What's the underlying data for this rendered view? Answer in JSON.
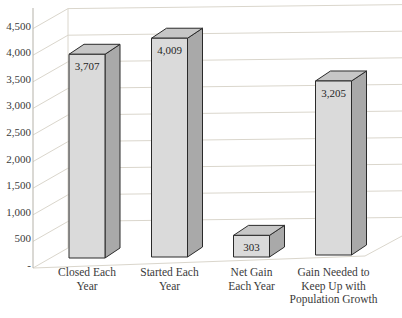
{
  "chart_data": {
    "type": "bar",
    "style": "3d-column",
    "title": "",
    "xlabel": "",
    "ylabel": "",
    "legend": false,
    "grid": true,
    "ylim": [
      0,
      4500
    ],
    "categories": [
      [
        "Closed Each",
        "Year"
      ],
      [
        "Started Each",
        "Year"
      ],
      [
        "Net Gain",
        "Each Year"
      ],
      [
        "Gain Needed to",
        "Keep Up with",
        "Population Growth"
      ]
    ],
    "values": [
      3707,
      4009,
      303,
      3205
    ],
    "value_labels": [
      "3,707",
      "4,009",
      "303",
      "3,205"
    ],
    "y_ticks": [
      {
        "value": 0,
        "label": "-"
      },
      {
        "value": 500,
        "label": "500"
      },
      {
        "value": 1000,
        "label": "1,000"
      },
      {
        "value": 1500,
        "label": "1,500"
      },
      {
        "value": 2000,
        "label": "2,000"
      },
      {
        "value": 2500,
        "label": "2,500"
      },
      {
        "value": 3000,
        "label": "3,000"
      },
      {
        "value": 3500,
        "label": "3,500"
      },
      {
        "value": 4000,
        "label": "4,000"
      },
      {
        "value": 4500,
        "label": "4,500"
      }
    ],
    "colors": {
      "bar_front": "#dadada",
      "bar_top": "#c6c6c6",
      "bar_side": "#a9a9a9",
      "bar_outline": "#2a2a2a",
      "gridline": "#dad6cc",
      "axis_line": "#b5b2a9",
      "tick_text": "#3a3a3a",
      "value_text": "#262626",
      "background": "#ffffff"
    }
  }
}
